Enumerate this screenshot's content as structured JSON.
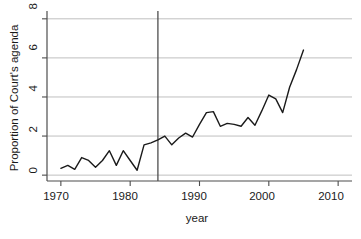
{
  "chart_data": {
    "type": "line",
    "title": "",
    "xlabel": "year",
    "ylabel": "Proportion of Court's agenda",
    "xlim": [
      1968,
      2012
    ],
    "ylim": [
      -0.3,
      8.4
    ],
    "xticks": [
      1970,
      1980,
      1990,
      2000,
      2010
    ],
    "xtick_labels": [
      "1970",
      "1980",
      "1990",
      "2000",
      "2010"
    ],
    "yticks": [
      0,
      2,
      4,
      6,
      8
    ],
    "ytick_labels": [
      "0",
      "2",
      "4",
      "6",
      "8"
    ],
    "grid": "horizontal",
    "legend": "none",
    "line_color": "#1a1a1a",
    "grid_color": "#bfbfbf",
    "axis_color": "#4d4d4d",
    "annotations": [
      {
        "type": "vertical-reference-line",
        "x": 1984,
        "color": "#4d4d4d",
        "label": ""
      }
    ],
    "series": [
      {
        "name": "Proportion of Court's agenda",
        "x": [
          1970,
          1971,
          1972,
          1973,
          1974,
          1975,
          1976,
          1977,
          1978,
          1979,
          1980,
          1981,
          1982,
          1983,
          1984,
          1985,
          1986,
          1987,
          1988,
          1989,
          1990,
          1991,
          1992,
          1993,
          1994,
          1995,
          1996,
          1997,
          1998,
          1999,
          2000,
          2001,
          2002,
          2003,
          2004,
          2005
        ],
        "values": [
          0.35,
          0.5,
          0.3,
          0.9,
          0.75,
          0.4,
          0.75,
          1.25,
          0.5,
          1.25,
          0.75,
          0.25,
          1.55,
          1.65,
          1.8,
          2.0,
          1.55,
          1.9,
          2.15,
          1.95,
          2.6,
          3.2,
          3.25,
          2.5,
          2.65,
          2.6,
          2.5,
          2.95,
          2.55,
          3.3,
          4.1,
          3.9,
          3.2,
          4.5,
          5.4,
          6.4
        ]
      }
    ]
  },
  "axis": {
    "x_title": "year",
    "y_title": "Proportion of Court's agenda"
  }
}
